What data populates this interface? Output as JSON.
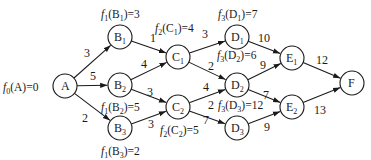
{
  "nodes": [
    {
      "id": "A",
      "name": "A",
      "sub": "",
      "x": 65,
      "y": 86
    },
    {
      "id": "B1",
      "name": "B",
      "sub": "1",
      "x": 120,
      "y": 37
    },
    {
      "id": "B2",
      "name": "B",
      "sub": "2",
      "x": 120,
      "y": 85
    },
    {
      "id": "B3",
      "name": "B",
      "sub": "3",
      "x": 120,
      "y": 128
    },
    {
      "id": "C1",
      "name": "C",
      "sub": "1",
      "x": 178,
      "y": 57
    },
    {
      "id": "C2",
      "name": "C",
      "sub": "2",
      "x": 178,
      "y": 107
    },
    {
      "id": "D1",
      "name": "D",
      "sub": "1",
      "x": 237,
      "y": 37
    },
    {
      "id": "D2",
      "name": "D",
      "sub": "2",
      "x": 237,
      "y": 85
    },
    {
      "id": "D3",
      "name": "D",
      "sub": "3",
      "x": 237,
      "y": 128
    },
    {
      "id": "E1",
      "name": "E",
      "sub": "1",
      "x": 292,
      "y": 58
    },
    {
      "id": "E2",
      "name": "E",
      "sub": "2",
      "x": 292,
      "y": 107
    },
    {
      "id": "F",
      "name": "F",
      "sub": "",
      "x": 352,
      "y": 83
    }
  ],
  "edges": [
    {
      "from": "A",
      "to": "B1",
      "weight": "3",
      "lx": 84,
      "ly": 57
    },
    {
      "from": "A",
      "to": "B2",
      "weight": "5",
      "lx": 90,
      "ly": 80
    },
    {
      "from": "A",
      "to": "B3",
      "weight": "2",
      "lx": 82,
      "ly": 122
    },
    {
      "from": "B1",
      "to": "C1",
      "weight": "1",
      "lx": 150,
      "ly": 42
    },
    {
      "from": "B2",
      "to": "C1",
      "weight": "4",
      "lx": 141,
      "ly": 68
    },
    {
      "from": "B2",
      "to": "C2",
      "weight": "3",
      "lx": 147,
      "ly": 96
    },
    {
      "from": "B3",
      "to": "C2",
      "weight": "3",
      "lx": 148,
      "ly": 128
    },
    {
      "from": "C1",
      "to": "D1",
      "weight": "3",
      "lx": 202,
      "ly": 38
    },
    {
      "from": "C1",
      "to": "D2",
      "weight": "2",
      "lx": 208,
      "ly": 70
    },
    {
      "from": "C2",
      "to": "D2",
      "weight": "4",
      "lx": 203,
      "ly": 91
    },
    {
      "from": "C2",
      "to": "D3",
      "weight": "7",
      "lx": 203,
      "ly": 124
    },
    {
      "from": "D1",
      "to": "E1",
      "weight": "10",
      "lx": 258,
      "ly": 42
    },
    {
      "from": "D2",
      "to": "E1",
      "weight": "9",
      "lx": 260,
      "ly": 69
    },
    {
      "from": "D2",
      "to": "E2",
      "weight": "7",
      "lx": 263,
      "ly": 99
    },
    {
      "from": "D3",
      "to": "E2",
      "weight": "9",
      "lx": 264,
      "ly": 131
    },
    {
      "from": "E1",
      "to": "F",
      "weight": "12",
      "lx": 316,
      "ly": 64
    },
    {
      "from": "E2",
      "to": "F",
      "weight": "13",
      "lx": 314,
      "ly": 114
    }
  ],
  "stage_values": [
    {
      "node": "A",
      "fn": "f",
      "stage": "0",
      "arg": "A",
      "argsub": "",
      "value": "0",
      "x": 3,
      "y": 91
    },
    {
      "node": "B1",
      "fn": "f",
      "stage": "1",
      "arg": "B",
      "argsub": "1",
      "value": "3",
      "x": 101,
      "y": 18
    },
    {
      "node": "B2",
      "fn": "f",
      "stage": "1",
      "arg": "B",
      "argsub": "2",
      "value": "5",
      "x": 101,
      "y": 111
    },
    {
      "node": "B3",
      "fn": "f",
      "stage": "1",
      "arg": "B",
      "argsub": "3",
      "value": "2",
      "x": 101,
      "y": 155
    },
    {
      "node": "C1",
      "fn": "f",
      "stage": "2",
      "arg": "C",
      "argsub": "1",
      "value": "4",
      "x": 155,
      "y": 32
    },
    {
      "node": "C2",
      "fn": "f",
      "stage": "2",
      "arg": "C",
      "argsub": "2",
      "value": "5",
      "x": 160,
      "y": 134
    },
    {
      "node": "D1",
      "fn": "f",
      "stage": "3",
      "arg": "D",
      "argsub": "1",
      "value": "7",
      "x": 218,
      "y": 18
    },
    {
      "node": "D2",
      "fn": "f",
      "stage": "3",
      "arg": "D",
      "argsub": "2",
      "value": "6",
      "x": 217,
      "y": 59
    },
    {
      "node": "D3",
      "fn": "f",
      "stage": "3",
      "arg": "D",
      "argsub": "3",
      "value": "12",
      "x": 218,
      "y": 109
    }
  ],
  "stray_label": {
    "text": "2",
    "x": 208,
    "y": 109
  },
  "colors": {
    "stroke": "#1a1a1a",
    "background": "#ffffff"
  }
}
